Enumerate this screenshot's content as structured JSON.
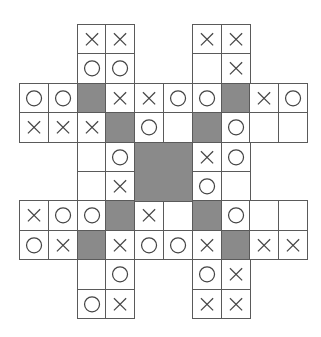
{
  "puzzle": {
    "type": "tic-tac-logic grid",
    "rows": 10,
    "cols": 10,
    "colors": {
      "line": "#5a5a5a",
      "shade": "#8a8a8a",
      "symbol": "#444444",
      "background": "#ffffff"
    },
    "legend": {
      "X": "cross",
      "O": "circle",
      "#": "shaded block",
      ".": "empty cell",
      " ": "no cell"
    },
    "grid": [
      "  XX  XX  ",
      "  OO  .X  ",
      "OO#XXOO#XO",
      "XXX#O.#O..",
      "  .O##XO  ",
      "  .X##O.  ",
      "XOO#X.#O..",
      "OX#XOOX#XX",
      "  .O  OX  ",
      "  OX  XX  "
    ]
  }
}
